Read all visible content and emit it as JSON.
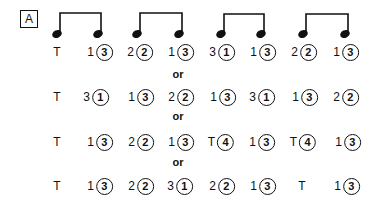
{
  "figure_label": "A",
  "note_pairs": 4,
  "separator": "or",
  "rows": [
    {
      "cells": [
        {
          "finger": "T",
          "circled": ""
        },
        {
          "finger": "1",
          "circled": "3"
        },
        {
          "finger": "2",
          "circled": "2"
        },
        {
          "finger": "1",
          "circled": "3"
        },
        {
          "finger": "3",
          "circled": "1"
        },
        {
          "finger": "1",
          "circled": "3"
        },
        {
          "finger": "2",
          "circled": "2"
        },
        {
          "finger": "1",
          "circled": "3"
        }
      ]
    },
    {
      "cells": [
        {
          "finger": "T",
          "circled": ""
        },
        {
          "finger": "3",
          "circled": "1"
        },
        {
          "finger": "1",
          "circled": "3"
        },
        {
          "finger": "2",
          "circled": "2"
        },
        {
          "finger": "1",
          "circled": "3"
        },
        {
          "finger": "3",
          "circled": "1"
        },
        {
          "finger": "1",
          "circled": "3"
        },
        {
          "finger": "2",
          "circled": "2"
        }
      ]
    },
    {
      "cells": [
        {
          "finger": "T",
          "circled": ""
        },
        {
          "finger": "1",
          "circled": "3"
        },
        {
          "finger": "2",
          "circled": "2"
        },
        {
          "finger": "1",
          "circled": "3"
        },
        {
          "finger": "T",
          "circled": "4"
        },
        {
          "finger": "1",
          "circled": "3"
        },
        {
          "finger": "T",
          "circled": "4"
        },
        {
          "finger": "1",
          "circled": "3"
        }
      ]
    },
    {
      "cells": [
        {
          "finger": "T",
          "circled": ""
        },
        {
          "finger": "1",
          "circled": "3"
        },
        {
          "finger": "2",
          "circled": "2"
        },
        {
          "finger": "3",
          "circled": "1"
        },
        {
          "finger": "2",
          "circled": "2"
        },
        {
          "finger": "1",
          "circled": "3"
        },
        {
          "finger": "T",
          "circled": ""
        },
        {
          "finger": "1",
          "circled": "3"
        }
      ]
    }
  ]
}
